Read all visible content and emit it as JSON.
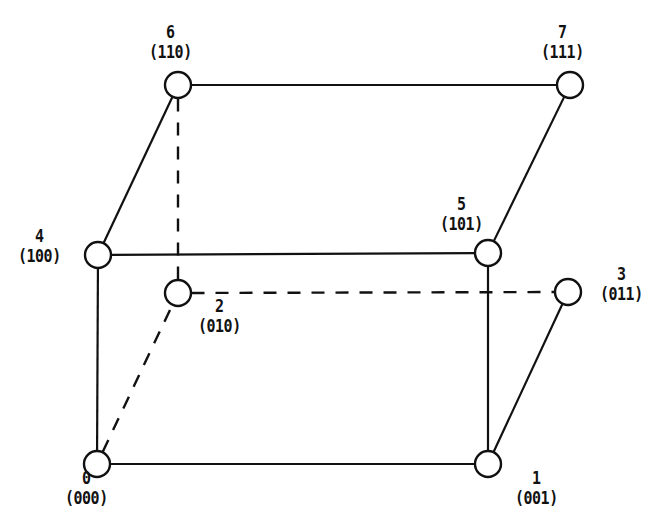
{
  "figure": {
    "background_color": "#ffffff",
    "line_color": "#111111",
    "node_fill_color": "#ffffff",
    "width": 664,
    "height": 532
  },
  "nodes": [
    {
      "id": "n0",
      "index": "0",
      "code": "(000)",
      "cx": 97,
      "cy": 464,
      "r": 13,
      "label_x": 62,
      "label_y": 470,
      "label_align": "lbl-center"
    },
    {
      "id": "n1",
      "index": "1",
      "code": "(001)",
      "cx": 488,
      "cy": 464,
      "r": 13,
      "label_x": 512,
      "label_y": 470,
      "label_align": "lbl-center"
    },
    {
      "id": "n2",
      "index": "2",
      "code": "(010)",
      "cx": 178,
      "cy": 293,
      "r": 13,
      "label_x": 195,
      "label_y": 298,
      "label_align": "lbl-center"
    },
    {
      "id": "n3",
      "index": "3",
      "code": "(011)",
      "cx": 568,
      "cy": 292,
      "r": 13,
      "label_x": 597,
      "label_y": 266,
      "label_align": "lbl-center"
    },
    {
      "id": "n4",
      "index": "4",
      "code": "(100)",
      "cx": 98,
      "cy": 255,
      "r": 13,
      "label_x": 15,
      "label_y": 228,
      "label_align": "lbl-center"
    },
    {
      "id": "n5",
      "index": "5",
      "code": "(101)",
      "cx": 488,
      "cy": 253,
      "r": 13,
      "label_x": 437,
      "label_y": 196,
      "label_align": "lbl-center"
    },
    {
      "id": "n6",
      "index": "6",
      "code": "(110)",
      "cx": 178,
      "cy": 85,
      "r": 13,
      "label_x": 146,
      "label_y": 24,
      "label_align": "lbl-center"
    },
    {
      "id": "n7",
      "index": "7",
      "code": "(111)",
      "cx": 570,
      "cy": 85,
      "r": 13,
      "label_x": 538,
      "label_y": 24,
      "label_align": "lbl-center"
    }
  ],
  "edges": [
    {
      "id": "e67",
      "from": "n6",
      "to": "n7",
      "style": "solid"
    },
    {
      "id": "e64",
      "from": "n6",
      "to": "n4",
      "style": "solid"
    },
    {
      "id": "e75",
      "from": "n7",
      "to": "n5",
      "style": "solid"
    },
    {
      "id": "e45",
      "from": "n4",
      "to": "n5",
      "style": "solid"
    },
    {
      "id": "e40",
      "from": "n4",
      "to": "n0",
      "style": "solid"
    },
    {
      "id": "e51",
      "from": "n5",
      "to": "n1",
      "style": "solid"
    },
    {
      "id": "e01",
      "from": "n0",
      "to": "n1",
      "style": "solid"
    },
    {
      "id": "e13",
      "from": "n1",
      "to": "n3",
      "style": "solid"
    },
    {
      "id": "e62",
      "from": "n6",
      "to": "n2",
      "style": "dashed"
    },
    {
      "id": "e23",
      "from": "n2",
      "to": "n3",
      "style": "dashed"
    },
    {
      "id": "e02",
      "from": "n0",
      "to": "n2",
      "style": "dashed"
    }
  ]
}
